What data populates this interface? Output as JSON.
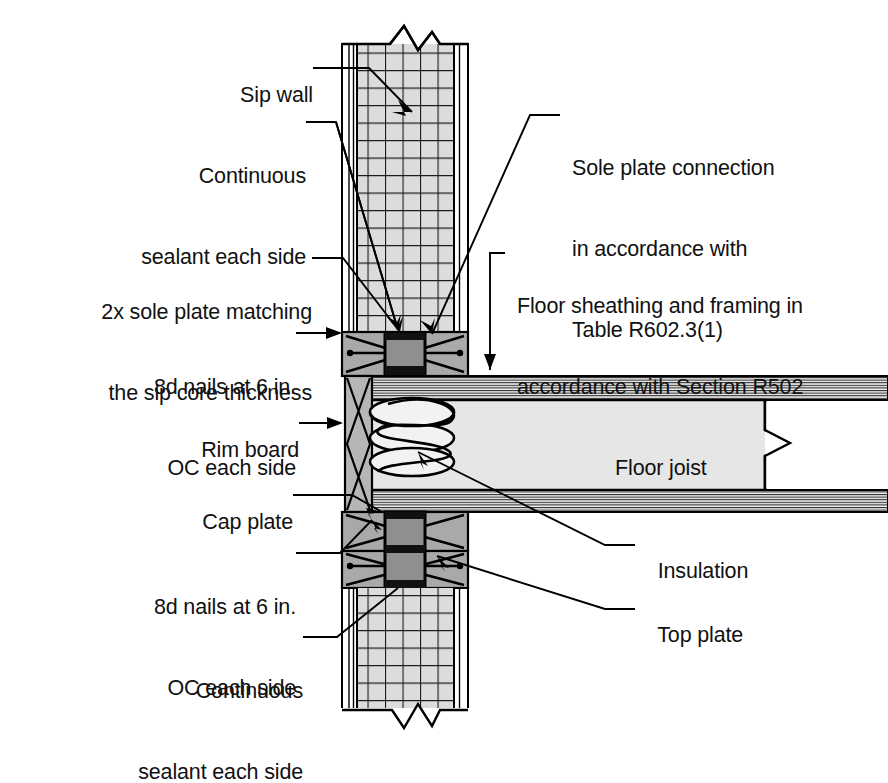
{
  "drawing": {
    "title": "SIP wall to floor framing connection detail",
    "colors": {
      "line": "#000000",
      "core_fill": "#dcdcdc",
      "plate_fill": "#a8a8a8",
      "joist_fill": "#e2e2e2",
      "rim_fill": "#b4b4b4",
      "sheathing_fill": "#ffffff",
      "background": "#ffffff"
    }
  },
  "labels": {
    "left": [
      {
        "id": "sip-wall",
        "text": "Sip wall"
      },
      {
        "id": "continuous-sealant-top",
        "text": "Continuous\nsealant each side"
      },
      {
        "id": "sole-plate-note",
        "text": "2x sole plate matching\nthe sip core thickness"
      },
      {
        "id": "nails-top",
        "text": "8d nails at 6 in.\nOC each side"
      },
      {
        "id": "rim-board",
        "text": "Rim board"
      },
      {
        "id": "cap-plate",
        "text": "Cap plate"
      },
      {
        "id": "nails-bottom",
        "text": "8d nails at 6 in.\nOC each side"
      },
      {
        "id": "continuous-sealant-bottom",
        "text": "Continuous\nsealant each side"
      }
    ],
    "right": [
      {
        "id": "sole-plate-connection",
        "text": "Sole plate connection\nin accordance with\nTable R602.3(1)"
      },
      {
        "id": "floor-sheathing",
        "text": "Floor sheathing and framing in\naccordance with Section R502"
      },
      {
        "id": "insulation",
        "text": "Insulation"
      },
      {
        "id": "top-plate",
        "text": "Top plate"
      }
    ],
    "inline": [
      {
        "id": "floor-joist",
        "text": "Floor joist"
      }
    ]
  },
  "label_text": {
    "sip_wall": "Sip wall",
    "continuous_sealant_top_l1": "Continuous",
    "continuous_sealant_top_l2": "sealant each side",
    "sole_plate_note_l1": "2x sole plate matching",
    "sole_plate_note_l2": "the sip core thickness",
    "nails_top_l1": "8d nails at 6 in.",
    "nails_top_l2": "OC each side",
    "rim_board": "Rim board",
    "cap_plate": "Cap plate",
    "nails_bottom_l1": "8d nails at 6 in.",
    "nails_bottom_l2": "OC each side",
    "continuous_sealant_bottom_l1": "Continuous",
    "continuous_sealant_bottom_l2": "sealant each side",
    "sole_plate_connection_l1": "Sole plate connection",
    "sole_plate_connection_l2": "in accordance with",
    "sole_plate_connection_l3": "Table R602.3(1)",
    "floor_sheathing_l1": "Floor sheathing and framing in",
    "floor_sheathing_l2": "accordance with Section R502",
    "insulation": "Insulation",
    "top_plate": "Top plate",
    "floor_joist": "Floor joist"
  },
  "geometry": {
    "wall": {
      "x": 342,
      "y": 40,
      "width": 126,
      "height": 675
    },
    "core": {
      "x": 357,
      "y": 40,
      "width": 97
    },
    "grid_cell": 17.5,
    "sole_plate": {
      "y": 330,
      "height": 44
    },
    "cap_plate": {
      "y": 487,
      "height": 40
    },
    "top_plate": {
      "y": 527,
      "height": 40
    },
    "joist": {
      "x": 468,
      "y": 372,
      "width": 420,
      "height": 122
    },
    "rim_board": {
      "x": 345,
      "y": 372,
      "width": 26,
      "height": 122
    }
  }
}
